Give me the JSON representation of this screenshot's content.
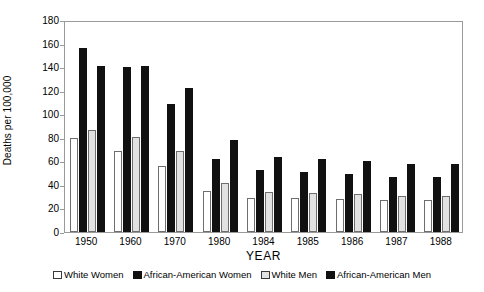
{
  "chart_data": {
    "type": "bar",
    "title": "",
    "xlabel": "YEAR",
    "ylabel": "Deaths per 100,000",
    "ylim": [
      0,
      180
    ],
    "yticks": [
      0,
      20,
      40,
      60,
      80,
      100,
      120,
      140,
      160,
      180
    ],
    "grid": false,
    "legend_position": "bottom",
    "categories": [
      "1950",
      "1960",
      "1970",
      "1980",
      "1984",
      "1985",
      "1986",
      "1987",
      "1988"
    ],
    "series": [
      {
        "name": "White Women",
        "swatch": "white",
        "values": [
          80,
          69,
          56,
          35,
          29,
          29,
          28,
          27,
          27
        ]
      },
      {
        "name": "African-American Women",
        "swatch": "black",
        "values": [
          156,
          140,
          109,
          62,
          53,
          51,
          49,
          47,
          47
        ]
      },
      {
        "name": "White Men",
        "swatch": "gray",
        "values": [
          87,
          81,
          69,
          42,
          34,
          33,
          32,
          31,
          31
        ]
      },
      {
        "name": "African-American Men",
        "swatch": "black",
        "values": [
          141,
          141,
          122,
          78,
          64,
          62,
          60,
          58,
          58
        ]
      }
    ]
  },
  "axis": {
    "y_title": "Deaths per 100,000",
    "x_title": "YEAR"
  }
}
